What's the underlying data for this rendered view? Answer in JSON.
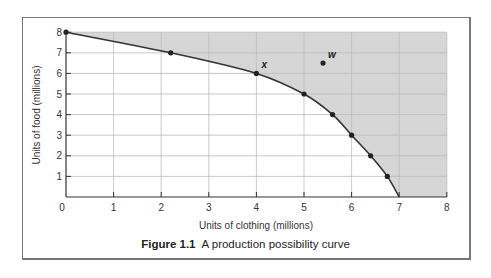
{
  "chart_data": {
    "type": "line",
    "title": "",
    "caption_label": "Figure 1.1",
    "caption_text": "A production possibility curve",
    "xlabel": "Units of clothing (millions)",
    "ylabel": "Units of food (millions)",
    "xlim": [
      0,
      8
    ],
    "ylim": [
      0,
      8
    ],
    "xticks": [
      "0",
      "1",
      "2",
      "3",
      "4",
      "5",
      "6",
      "7",
      "8"
    ],
    "yticks": [
      "1",
      "2",
      "3",
      "4",
      "5",
      "6",
      "7",
      "8"
    ],
    "grid": true,
    "shaded_region": "above curve (unattainable)",
    "colors": {
      "shade": "#d6d6d6",
      "curve": "#333333",
      "grid": "#bbbbbb"
    },
    "series": [
      {
        "name": "Production possibility curve",
        "points": [
          {
            "x": 0,
            "y": 8
          },
          {
            "x": 2.2,
            "y": 7
          },
          {
            "x": 4,
            "y": 6
          },
          {
            "x": 5,
            "y": 5
          },
          {
            "x": 5.6,
            "y": 4
          },
          {
            "x": 6,
            "y": 3
          },
          {
            "x": 6.4,
            "y": 2
          },
          {
            "x": 6.75,
            "y": 1
          },
          {
            "x": 7,
            "y": 0
          }
        ]
      }
    ],
    "annotations": [
      {
        "label": "x",
        "x": 4,
        "y": 6
      },
      {
        "label": "w",
        "x": 5.4,
        "y": 6.5
      }
    ]
  }
}
